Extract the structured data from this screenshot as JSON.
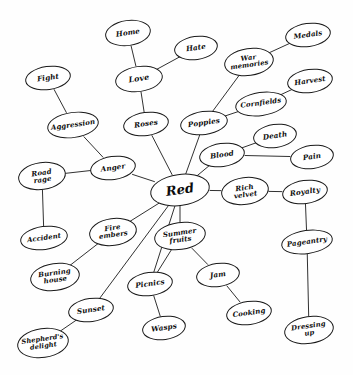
{
  "diagram": {
    "title": "Red",
    "type": "mind-map",
    "width": 353,
    "height": 375,
    "background_color": "#ffffff",
    "stroke_color": "#1a1a1a",
    "text_color": "#0d0d0d",
    "central_node": "red",
    "nodes": [
      {
        "id": "red",
        "label": "Red",
        "x": 180,
        "y": 190,
        "rx": 30,
        "ry": 16,
        "font": 13,
        "central": true
      },
      {
        "id": "home",
        "label": "Home",
        "x": 128,
        "y": 33,
        "rx": 23,
        "ry": 13,
        "font": 7.2
      },
      {
        "id": "love",
        "label": "Love",
        "x": 139,
        "y": 79,
        "rx": 24,
        "ry": 13,
        "font": 7.8
      },
      {
        "id": "hate",
        "label": "Hate",
        "x": 196,
        "y": 48,
        "rx": 22,
        "ry": 12,
        "font": 7.2
      },
      {
        "id": "roses",
        "label": "Roses",
        "x": 146,
        "y": 124,
        "rx": 23,
        "ry": 12,
        "font": 7.2
      },
      {
        "id": "fight",
        "label": "Fight",
        "x": 48,
        "y": 78,
        "rx": 23,
        "ry": 12,
        "font": 7.2
      },
      {
        "id": "aggression",
        "label": "Aggression",
        "x": 73,
        "y": 125,
        "rx": 26,
        "ry": 13,
        "font": 7.0
      },
      {
        "id": "anger",
        "label": "Anger",
        "x": 113,
        "y": 168,
        "rx": 23,
        "ry": 12,
        "font": 7.2
      },
      {
        "id": "road-rage",
        "label": "Road\nrage",
        "x": 42,
        "y": 176,
        "rx": 24,
        "ry": 14,
        "font": 7.0
      },
      {
        "id": "accident",
        "label": "Accident",
        "x": 44,
        "y": 238,
        "rx": 24,
        "ry": 12,
        "font": 6.8
      },
      {
        "id": "poppies",
        "label": "Poppies",
        "x": 204,
        "y": 123,
        "rx": 24,
        "ry": 12,
        "font": 7.2
      },
      {
        "id": "war-memories",
        "label": "War\nmemories",
        "x": 249,
        "y": 62,
        "rx": 25,
        "ry": 14,
        "font": 6.8
      },
      {
        "id": "medals",
        "label": "Medals",
        "x": 308,
        "y": 35,
        "rx": 23,
        "ry": 12,
        "font": 7.0
      },
      {
        "id": "cornfields",
        "label": "Cornfields",
        "x": 261,
        "y": 104,
        "rx": 26,
        "ry": 12,
        "font": 6.9
      },
      {
        "id": "harvest",
        "label": "Harvest",
        "x": 310,
        "y": 81,
        "rx": 23,
        "ry": 12,
        "font": 7.0
      },
      {
        "id": "blood",
        "label": "Blood",
        "x": 222,
        "y": 155,
        "rx": 23,
        "ry": 12,
        "font": 7.2
      },
      {
        "id": "death",
        "label": "Death",
        "x": 275,
        "y": 136,
        "rx": 22,
        "ry": 12,
        "font": 7.2
      },
      {
        "id": "pain",
        "label": "Pain",
        "x": 312,
        "y": 157,
        "rx": 22,
        "ry": 12,
        "font": 7.2
      },
      {
        "id": "rich-velvet",
        "label": "Rich\nvelvet",
        "x": 245,
        "y": 191,
        "rx": 24,
        "ry": 14,
        "font": 7.0
      },
      {
        "id": "royalty",
        "label": "Royalty",
        "x": 305,
        "y": 192,
        "rx": 23,
        "ry": 12,
        "font": 7.2
      },
      {
        "id": "pageantry",
        "label": "Pageantry",
        "x": 307,
        "y": 242,
        "rx": 26,
        "ry": 12,
        "font": 7.0
      },
      {
        "id": "dressing-up",
        "label": "Dressing\nup",
        "x": 309,
        "y": 330,
        "rx": 25,
        "ry": 14,
        "font": 6.8
      },
      {
        "id": "fire-embers",
        "label": "Fire\nembers",
        "x": 113,
        "y": 232,
        "rx": 24,
        "ry": 14,
        "font": 6.9
      },
      {
        "id": "burning-house",
        "label": "Burning\nhouse",
        "x": 55,
        "y": 277,
        "rx": 25,
        "ry": 14,
        "font": 6.9
      },
      {
        "id": "sunset",
        "label": "Sunset",
        "x": 91,
        "y": 310,
        "rx": 23,
        "ry": 12,
        "font": 7.2
      },
      {
        "id": "shepherds-delight",
        "label": "Shepherd's\ndelight",
        "x": 43,
        "y": 343,
        "rx": 26,
        "ry": 15,
        "font": 6.6
      },
      {
        "id": "summer-fruits",
        "label": "Summer\nfruits",
        "x": 180,
        "y": 236,
        "rx": 26,
        "ry": 14,
        "font": 7.0
      },
      {
        "id": "picnics",
        "label": "Picnics",
        "x": 150,
        "y": 284,
        "rx": 23,
        "ry": 12,
        "font": 7.2
      },
      {
        "id": "wasps",
        "label": "Wasps",
        "x": 164,
        "y": 328,
        "rx": 22,
        "ry": 12,
        "font": 7.2
      },
      {
        "id": "jam",
        "label": "Jam",
        "x": 218,
        "y": 275,
        "rx": 22,
        "ry": 12,
        "font": 7.2
      },
      {
        "id": "cooking",
        "label": "Cooking",
        "x": 249,
        "y": 313,
        "rx": 23,
        "ry": 12,
        "font": 7.0
      }
    ],
    "edges": [
      {
        "from": "red",
        "to": "anger"
      },
      {
        "from": "red",
        "to": "roses"
      },
      {
        "from": "red",
        "to": "poppies"
      },
      {
        "from": "red",
        "to": "blood"
      },
      {
        "from": "red",
        "to": "rich-velvet"
      },
      {
        "from": "red",
        "to": "summer-fruits"
      },
      {
        "from": "red",
        "to": "picnics"
      },
      {
        "from": "red",
        "to": "fire-embers"
      },
      {
        "from": "red",
        "to": "sunset"
      },
      {
        "from": "roses",
        "to": "love"
      },
      {
        "from": "love",
        "to": "home"
      },
      {
        "from": "love",
        "to": "hate"
      },
      {
        "from": "anger",
        "to": "aggression"
      },
      {
        "from": "aggression",
        "to": "fight"
      },
      {
        "from": "anger",
        "to": "road-rage"
      },
      {
        "from": "road-rage",
        "to": "accident"
      },
      {
        "from": "poppies",
        "to": "war-memories"
      },
      {
        "from": "war-memories",
        "to": "medals"
      },
      {
        "from": "poppies",
        "to": "cornfields"
      },
      {
        "from": "cornfields",
        "to": "harvest"
      },
      {
        "from": "blood",
        "to": "death"
      },
      {
        "from": "blood",
        "to": "pain"
      },
      {
        "from": "rich-velvet",
        "to": "royalty"
      },
      {
        "from": "royalty",
        "to": "pageantry"
      },
      {
        "from": "pageantry",
        "to": "dressing-up"
      },
      {
        "from": "fire-embers",
        "to": "burning-house"
      },
      {
        "from": "sunset",
        "to": "shepherds-delight"
      },
      {
        "from": "summer-fruits",
        "to": "picnics"
      },
      {
        "from": "picnics",
        "to": "wasps"
      },
      {
        "from": "summer-fruits",
        "to": "jam"
      },
      {
        "from": "jam",
        "to": "cooking"
      }
    ]
  }
}
